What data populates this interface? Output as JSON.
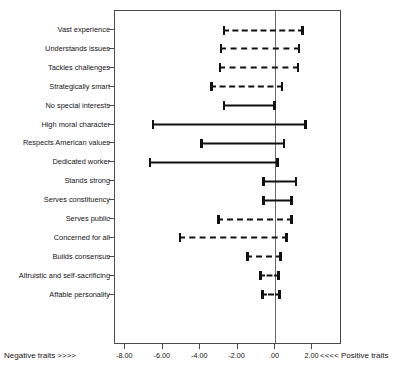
{
  "chart_data": {
    "type": "bar",
    "title": "",
    "subtitle": "",
    "xlabel": "",
    "ylabel": "",
    "xlim": [
      -8.0,
      2.0
    ],
    "grid": false,
    "legend_position": "none",
    "orientation": "horizontal",
    "plot_note": "Horizontal confidence-interval (error bar) plot. Each row shows a point range spanning a lower and upper bound. Dashed bars and solid bars denote two different marker styles. A vertical reference line is drawn at 0.00.",
    "reference_line": 0.0,
    "x_ticks": [
      -8.0,
      -6.0,
      -4.0,
      -2.0,
      0.0,
      2.0
    ],
    "x_tick_labels": [
      "-8.00",
      "-6.00",
      "-4.00",
      "-2.00",
      ".00",
      "2.00"
    ],
    "axis_captions": {
      "left": "Negative traits >>>>",
      "right": "<<<< Positive traits"
    },
    "categories": [
      "Vast experience",
      "Understands issues",
      "Tackles challenges",
      "Strategically smart",
      "No special interests",
      "High moral character",
      "Respects American values",
      "Dedicated worker",
      "Stands strong",
      "Serves constituency",
      "Serves public",
      "Concerned for all",
      "Builds consensus",
      "Altruistic and self-sacrificing",
      "Affable personality"
    ],
    "series": [
      {
        "name": "Confidence interval",
        "lower": [
          -2.8,
          -2.95,
          -3.0,
          -3.45,
          -2.8,
          -6.6,
          -4.0,
          -6.75,
          -0.7,
          -0.7,
          -3.1,
          -5.15,
          -1.55,
          -0.85,
          -0.75
        ],
        "upper": [
          1.55,
          1.35,
          1.3,
          0.45,
          0.05,
          1.7,
          0.55,
          0.2,
          1.2,
          0.95,
          0.95,
          0.7,
          0.35,
          0.25,
          0.3
        ],
        "style": [
          "dashed",
          "dashed",
          "dashed",
          "dashed",
          "solid",
          "solid",
          "solid",
          "solid",
          "solid",
          "solid",
          "dashed",
          "dashed",
          "dashed",
          "dashed",
          "dashed"
        ]
      }
    ]
  },
  "icons": {
    "cap_left": "errorbar-left-cap",
    "cap_right": "errorbar-right-cap"
  }
}
